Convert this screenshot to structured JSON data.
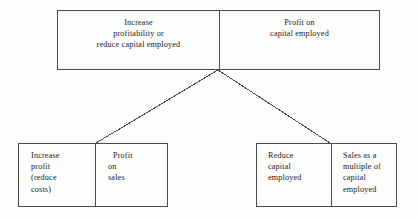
{
  "diagram": {
    "type": "tree",
    "colors": {
      "background": "#fdfdfb",
      "border": "#4a4a4a",
      "text": "#1b1b1b",
      "connector": "#4a4a4a"
    },
    "nodes": {
      "top": {
        "left_cell": {
          "lines": [
            "Increase",
            "profitability or",
            "reduce capital employed"
          ],
          "align": "center"
        },
        "right_cell": {
          "lines": [
            "Profit on",
            "capital employed"
          ],
          "align": "center"
        }
      },
      "bottom_left": {
        "left_cell": {
          "lines": [
            "Increase",
            "profit",
            "(reduce",
            "costs)"
          ],
          "align": "left"
        },
        "right_cell": {
          "lines": [
            "Profit",
            "on",
            "sales"
          ],
          "align": "left"
        }
      },
      "bottom_right": {
        "left_cell": {
          "lines": [
            "Reduce",
            "capital",
            "employed"
          ],
          "align": "left"
        },
        "right_cell": {
          "lines": [
            "Sales as a",
            "multiple of",
            "capital",
            "employed"
          ],
          "align": "left"
        }
      }
    },
    "connectors": [
      {
        "name": "connector-to-bottom-left",
        "x1": 218,
        "y1": 70,
        "x2": 96,
        "y2": 143
      },
      {
        "name": "connector-to-bottom-right",
        "x1": 218,
        "y1": 70,
        "x2": 330,
        "y2": 143
      }
    ]
  }
}
